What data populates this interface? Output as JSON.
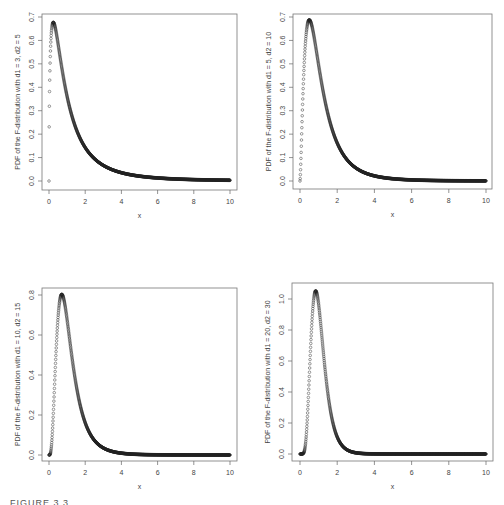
{
  "figure": {
    "caption": "FIGURE 3.3"
  },
  "chart_data": [
    {
      "type": "scatter",
      "title": "",
      "d1": 3,
      "d2": 5,
      "xlabel": "x",
      "ylabel": "PDF of the F-distribution with d1 = 3, d2 = 5",
      "xlim": [
        0,
        10
      ],
      "ylim": [
        0,
        0.7
      ],
      "xticks": [
        "0",
        "2",
        "4",
        "6",
        "8",
        "10"
      ],
      "yticks": [
        "0.0",
        "0.1",
        "0.2",
        "0.3",
        "0.4",
        "0.5",
        "0.6",
        "0.7"
      ],
      "ytick_values": [
        0,
        0.1,
        0.2,
        0.3,
        0.4,
        0.5,
        0.6,
        0.7
      ],
      "grid": false,
      "box": {
        "left": 42,
        "top": 14,
        "right": 237,
        "bottom": 190
      },
      "plot": {
        "x0": 49,
        "x1": 230,
        "y0": 181,
        "ymaxpx": 17
      },
      "peak": {
        "x": 0.2,
        "y": 0.68
      },
      "x": [
        0,
        0.25,
        0.5,
        1,
        1.5,
        2,
        3,
        4,
        6,
        8,
        10
      ],
      "values": [
        0,
        0.676,
        0.608,
        0.365,
        0.222,
        0.141,
        0.064,
        0.032,
        0.011,
        0.005,
        0.002
      ]
    },
    {
      "type": "scatter",
      "title": "",
      "d1": 5,
      "d2": 10,
      "xlabel": "x",
      "ylabel": "PDF of the F-distribution with d1 = 5, d2 = 10",
      "xlim": [
        0,
        10
      ],
      "ylim": [
        0,
        0.7
      ],
      "xticks": [
        "0",
        "2",
        "4",
        "6",
        "8",
        "10"
      ],
      "yticks": [
        "0.0",
        "0.1",
        "0.2",
        "0.3",
        "0.4",
        "0.5",
        "0.6",
        "0.7"
      ],
      "ytick_values": [
        0,
        0.1,
        0.2,
        0.3,
        0.4,
        0.5,
        0.6,
        0.7
      ],
      "grid": false,
      "box": {
        "left": 293,
        "top": 14,
        "right": 492,
        "bottom": 189
      },
      "plot": {
        "x0": 300,
        "x1": 486,
        "y0": 181,
        "ymaxpx": 17
      },
      "peak": {
        "x": 0.5,
        "y": 0.69
      },
      "x": [
        0,
        0.25,
        0.5,
        1,
        1.5,
        2,
        3,
        4,
        6,
        8,
        10
      ],
      "values": [
        0,
        0.497,
        0.687,
        0.495,
        0.283,
        0.153,
        0.048,
        0.017,
        0.003,
        0.001,
        0.0003
      ]
    },
    {
      "type": "scatter",
      "title": "",
      "d1": 10,
      "d2": 15,
      "xlabel": "x",
      "ylabel": "PDF of the F-distribution with d1 = 10, d2 = 15",
      "xlim": [
        0,
        10
      ],
      "ylim": [
        0,
        0.8
      ],
      "xticks": [
        "0",
        "2",
        "4",
        "6",
        "8",
        "10"
      ],
      "yticks": [
        "0.0",
        "0.2",
        "0.4",
        "0.6",
        "0.8"
      ],
      "ytick_values": [
        0,
        0.2,
        0.4,
        0.6,
        0.8
      ],
      "grid": false,
      "box": {
        "left": 42,
        "top": 288,
        "right": 237,
        "bottom": 461
      },
      "plot": {
        "x0": 49,
        "x1": 230,
        "y0": 455,
        "ymaxpx": 295
      },
      "peak": {
        "x": 0.7,
        "y": 0.8
      },
      "x": [
        0,
        0.25,
        0.5,
        0.7,
        1,
        1.5,
        2,
        3,
        4,
        6,
        10
      ],
      "values": [
        0,
        0.146,
        0.657,
        0.8,
        0.676,
        0.343,
        0.143,
        0.022,
        0.004,
        0.0002,
        0
      ]
    },
    {
      "type": "scatter",
      "title": "",
      "d1": 20,
      "d2": 30,
      "xlabel": "x",
      "ylabel": "PDF of the F-distribution with d1 = 20, d2 = 30",
      "xlim": [
        0,
        10
      ],
      "ylim": [
        0,
        1.0
      ],
      "xticks": [
        "0",
        "2",
        "4",
        "6",
        "8",
        "10"
      ],
      "yticks": [
        "0.0",
        "0.2",
        "0.4",
        "0.6",
        "0.8",
        "1.0"
      ],
      "ytick_values": [
        0,
        0.2,
        0.4,
        0.6,
        0.8,
        1.0
      ],
      "grid": false,
      "box": {
        "left": 292,
        "top": 283,
        "right": 493,
        "bottom": 461
      },
      "plot": {
        "x0": 300,
        "x1": 486,
        "y0": 454,
        "ymaxpx": 299
      },
      "peak": {
        "x": 0.85,
        "y": 1.05
      },
      "x": [
        0,
        0.25,
        0.5,
        0.85,
        1,
        1.5,
        2,
        3,
        4,
        6,
        10
      ],
      "values": [
        0,
        0.008,
        0.472,
        1.05,
        0.985,
        0.391,
        0.083,
        0.003,
        0.0001,
        0,
        0
      ]
    }
  ]
}
